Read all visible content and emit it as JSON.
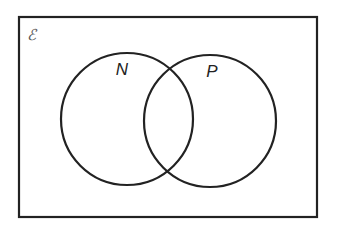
{
  "diagram": {
    "type": "venn",
    "universal_set": {
      "label": "ℰ",
      "x": 19,
      "y": 17,
      "width": 298,
      "height": 200,
      "stroke": "#222222"
    },
    "sets": [
      {
        "name": "N",
        "label": "N",
        "cx": 127,
        "cy": 119,
        "r": 66,
        "label_x": 122,
        "label_y": 75
      },
      {
        "name": "P",
        "label": "P",
        "cx": 210,
        "cy": 121,
        "r": 66,
        "label_x": 212,
        "label_y": 77
      }
    ],
    "stroke_color": "#222222",
    "stroke_width": 2.2
  }
}
